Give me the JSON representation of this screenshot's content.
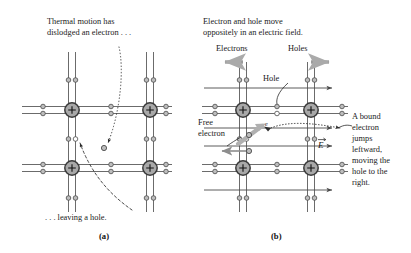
{
  "figure": {
    "type": "physics-diagram",
    "background_color": "#ffffff",
    "ink_color": "#1a1a1a",
    "lattice_line_color": "#4a4a4a",
    "atom_fill_color": "#a8a8a8",
    "atom_stroke_color": "#3a3a3a",
    "electron_fill_color": "#bdbdbd",
    "electron_stroke_color": "#4a4a4a",
    "hole_fill_color": "#ffffff",
    "jump_arrow_color": "#b0b0b0"
  },
  "panel_a": {
    "letter": "(a)",
    "caption_top_line1": "Thermal motion has",
    "caption_top_line2": "dislodged an electron . . .",
    "caption_bottom": ". . . leaving a hole.",
    "annotations": {
      "freed_electron_label": "free electron",
      "vacancy_label": "hole"
    }
  },
  "panel_b": {
    "letter": "(b)",
    "caption_top_line1": "Electron and hole move",
    "caption_top_line2": "oppositely in an electric field.",
    "electrons_label": "Electrons",
    "electrons_direction": "left",
    "holes_label": "Holes",
    "holes_direction": "right",
    "hole_label": "Hole",
    "free_electron_label_line1": "Free",
    "free_electron_label_line2": "electron",
    "field_symbol": "E",
    "field_symbol_is_vector": true,
    "electron_glyph": "e",
    "side_note_lines": [
      "A bound",
      "electron",
      "jumps",
      "leftward,",
      "moving the",
      "hole to the",
      "right."
    ]
  }
}
